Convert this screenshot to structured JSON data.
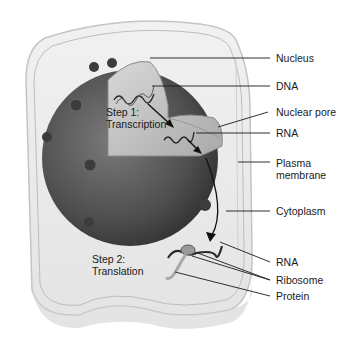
{
  "figure": {
    "steps": [
      {
        "line1": "Step 1:",
        "line2": "Transcription"
      },
      {
        "line1": "Step 2:",
        "line2": "Translation"
      }
    ],
    "labels": [
      {
        "id": "nucleus",
        "text": "Nucleus"
      },
      {
        "id": "dna",
        "text": "DNA"
      },
      {
        "id": "nuclear-pore",
        "text": "Nuclear pore"
      },
      {
        "id": "rna-1",
        "text": "RNA"
      },
      {
        "id": "plasma-membrane",
        "line1": "Plasma",
        "line2": "membrane"
      },
      {
        "id": "cytoplasm",
        "text": "Cytoplasm"
      },
      {
        "id": "rna-2",
        "text": "RNA"
      },
      {
        "id": "ribosome",
        "text": "Ribosome"
      },
      {
        "id": "protein",
        "text": "Protein"
      }
    ],
    "colors": {
      "cell_fill": "#ececec",
      "cell_edge": "#c9c9c9",
      "nucleus_dark": "#4a4a4a",
      "nucleus_interior": "#c8c8c8",
      "line": "#1a1a1a"
    }
  }
}
